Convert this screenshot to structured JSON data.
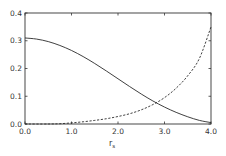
{
  "chart_data": {
    "type": "line",
    "title": "",
    "xlabel": "r",
    "xlabel_subscript": "s",
    "ylabel": "",
    "xlim": [
      0.0,
      4.0
    ],
    "ylim": [
      0.0,
      0.4
    ],
    "xticks": [
      "0.0",
      "1.0",
      "2.0",
      "3.0",
      "4.0"
    ],
    "yticks": [
      "0.0",
      "0.1",
      "0.2",
      "0.3",
      "0.4"
    ],
    "grid": false,
    "legend": null,
    "series": [
      {
        "name": "solid",
        "style": "solid",
        "x": [
          0.0,
          0.25,
          0.5,
          0.75,
          1.0,
          1.25,
          1.5,
          1.75,
          2.0,
          2.25,
          2.5,
          2.75,
          3.0,
          3.25,
          3.5,
          3.75,
          4.0
        ],
        "values": [
          0.31,
          0.306,
          0.297,
          0.283,
          0.265,
          0.243,
          0.218,
          0.191,
          0.163,
          0.135,
          0.108,
          0.083,
          0.061,
          0.042,
          0.026,
          0.013,
          0.005
        ]
      },
      {
        "name": "dashed",
        "style": "dashed",
        "x": [
          0.0,
          0.5,
          0.75,
          1.0,
          1.25,
          1.5,
          1.75,
          2.0,
          2.25,
          2.5,
          2.75,
          3.0,
          3.25,
          3.5,
          3.75,
          4.0
        ],
        "values": [
          0.0,
          0.0,
          0.001,
          0.004,
          0.008,
          0.013,
          0.019,
          0.027,
          0.037,
          0.051,
          0.07,
          0.095,
          0.129,
          0.174,
          0.236,
          0.35
        ]
      }
    ]
  },
  "colors": {
    "axis": "#333333",
    "line": "#2a2a2a",
    "background": "#ffffff"
  }
}
